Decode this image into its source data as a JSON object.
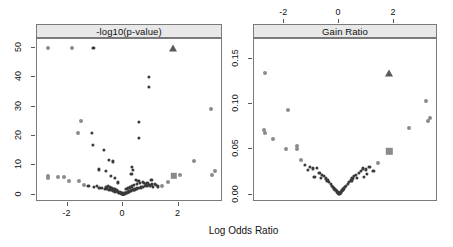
{
  "figure": {
    "xlabel": "Log Odds Ratio",
    "panels": [
      {
        "key": "pval",
        "strip_label": "-log10(p-value)"
      },
      {
        "key": "gain",
        "strip_label": "Gain Ratio"
      }
    ]
  },
  "colors": {
    "strip_fill": "#e8e8e8",
    "frame": "#7a7a7a",
    "point_dense": "#3a3a3a",
    "point_light": "#8b8b8b",
    "highlight_triangle": "#5a5a5a",
    "highlight_square": "#8a8a8a",
    "text": "#111111"
  },
  "chart_data": [
    {
      "type": "scatter",
      "panel": "-log10(p-value)",
      "title": "-log10(p-value)",
      "xlabel": "Log Odds Ratio",
      "ylabel": "-log10(p-value)",
      "xlim": [
        -3.1,
        3.6
      ],
      "ylim": [
        -2.5,
        53
      ],
      "xticks": [
        -2,
        0,
        2
      ],
      "xticklabels": [
        "-2",
        "0",
        "2"
      ],
      "xaxis_side": "bottom",
      "yticks": [
        0,
        10,
        20,
        30,
        40,
        50
      ],
      "yticklabels": [
        "0",
        "10",
        "20",
        "30",
        "40",
        "50"
      ],
      "grid": false,
      "legend": false,
      "points": [
        [
          -2.7,
          50.0
        ],
        [
          -1.85,
          50.0
        ],
        [
          -1.07,
          50.0
        ],
        [
          0.92,
          40.2
        ],
        [
          0.92,
          36.8
        ],
        [
          3.18,
          29.2
        ],
        [
          -1.53,
          25.2
        ],
        [
          0.58,
          24.9
        ],
        [
          -1.62,
          20.9
        ],
        [
          -1.12,
          21.1
        ],
        [
          0.57,
          19.2
        ],
        [
          -1.1,
          17.0
        ],
        [
          -0.7,
          15.3
        ],
        [
          -0.52,
          11.8
        ],
        [
          -0.38,
          11.3
        ],
        [
          2.55,
          11.4
        ],
        [
          -0.88,
          8.6
        ],
        [
          -0.62,
          8.1
        ],
        [
          0.33,
          9.5
        ],
        [
          0.35,
          8.3
        ],
        [
          3.3,
          7.9
        ],
        [
          3.22,
          6.8
        ],
        [
          2.05,
          6.6
        ],
        [
          -2.72,
          6.3
        ],
        [
          -2.7,
          5.7
        ],
        [
          -2.35,
          6.1
        ],
        [
          -2.12,
          5.9
        ],
        [
          -1.95,
          4.7
        ],
        [
          -1.58,
          4.6
        ],
        [
          -0.45,
          6.4
        ],
        [
          -0.3,
          5.6
        ],
        [
          -0.18,
          4.2
        ],
        [
          0.3,
          7.2
        ],
        [
          0.45,
          5.0
        ],
        [
          0.55,
          4.6
        ],
        [
          0.72,
          4.4
        ],
        [
          0.88,
          4.1
        ],
        [
          1.02,
          5.1
        ],
        [
          1.18,
          3.2
        ],
        [
          1.42,
          3.1
        ],
        [
          1.62,
          4.3
        ],
        [
          -1.4,
          3.4
        ],
        [
          -1.25,
          3.0
        ],
        [
          -1.05,
          2.6
        ],
        [
          -0.95,
          2.9
        ],
        [
          -0.85,
          2.2
        ],
        [
          -0.75,
          2.4
        ],
        [
          -0.66,
          1.9
        ],
        [
          -0.58,
          2.1
        ],
        [
          -0.5,
          1.6
        ],
        [
          -0.44,
          1.8
        ],
        [
          -0.38,
          1.3
        ],
        [
          -0.33,
          1.5
        ],
        [
          -0.28,
          1.1
        ],
        [
          -0.24,
          1.2
        ],
        [
          -0.2,
          0.85
        ],
        [
          -0.17,
          0.95
        ],
        [
          -0.14,
          0.7
        ],
        [
          -0.11,
          0.75
        ],
        [
          -0.09,
          0.55
        ],
        [
          -0.07,
          0.6
        ],
        [
          -0.05,
          0.4
        ],
        [
          -0.04,
          0.45
        ],
        [
          -0.02,
          0.3
        ],
        [
          -0.01,
          0.25
        ],
        [
          0.01,
          0.22
        ],
        [
          0.02,
          0.3
        ],
        [
          0.04,
          0.38
        ],
        [
          0.05,
          0.45
        ],
        [
          0.07,
          0.5
        ],
        [
          0.09,
          0.58
        ],
        [
          0.11,
          0.66
        ],
        [
          0.13,
          0.72
        ],
        [
          0.16,
          0.85
        ],
        [
          0.19,
          0.95
        ],
        [
          0.22,
          1.1
        ],
        [
          0.25,
          1.2
        ],
        [
          0.29,
          1.35
        ],
        [
          0.33,
          1.5
        ],
        [
          0.37,
          1.65
        ],
        [
          0.41,
          1.8
        ],
        [
          0.46,
          1.95
        ],
        [
          0.51,
          2.15
        ],
        [
          0.57,
          2.3
        ],
        [
          0.63,
          2.5
        ],
        [
          0.7,
          2.7
        ],
        [
          0.78,
          2.9
        ],
        [
          0.86,
          3.1
        ],
        [
          0.95,
          3.3
        ],
        [
          1.05,
          3.5
        ],
        [
          1.15,
          3.7
        ],
        [
          -0.62,
          2.6
        ],
        [
          -0.55,
          2.9
        ],
        [
          -0.48,
          2.5
        ],
        [
          -0.42,
          2.2
        ],
        [
          -0.36,
          2.0
        ],
        [
          -0.31,
          1.85
        ],
        [
          -0.26,
          1.7
        ],
        [
          -0.22,
          1.55
        ],
        [
          0.12,
          1.9
        ],
        [
          0.18,
          2.2
        ],
        [
          0.24,
          2.5
        ],
        [
          0.31,
          2.8
        ],
        [
          0.4,
          3.2
        ],
        [
          0.5,
          3.6
        ],
        [
          0.6,
          3.9
        ],
        [
          0.74,
          4.0
        ],
        [
          0.84,
          3.5
        ],
        [
          0.96,
          2.9
        ],
        [
          1.08,
          2.6
        ],
        [
          1.25,
          2.8
        ]
      ],
      "highlight_triangle": [
        1.8,
        50.0
      ],
      "highlight_square": [
        1.82,
        6.5
      ]
    },
    {
      "type": "scatter",
      "panel": "Gain Ratio",
      "title": "Gain Ratio",
      "xlabel": "Log Odds Ratio",
      "ylabel": "Gain Ratio",
      "xlim": [
        -3.1,
        3.6
      ],
      "ylim": [
        -0.008,
        0.172
      ],
      "xticks": [
        -2,
        0,
        2
      ],
      "xticklabels": [
        "-2",
        "0",
        "2"
      ],
      "xaxis_side": "top",
      "yticks": [
        0.0,
        0.05,
        0.1,
        0.15
      ],
      "yticklabels": [
        "0.00",
        "0.05",
        "0.10",
        "0.15"
      ],
      "grid": false,
      "legend": false,
      "points": [
        [
          -2.7,
          0.135
        ],
        [
          -1.85,
          0.094
        ],
        [
          -2.72,
          0.071
        ],
        [
          -2.7,
          0.068
        ],
        [
          -2.4,
          0.062
        ],
        [
          -1.95,
          0.051
        ],
        [
          -1.55,
          0.054
        ],
        [
          -1.52,
          0.05
        ],
        [
          -1.4,
          0.038
        ],
        [
          -1.25,
          0.033
        ],
        [
          -1.07,
          0.031
        ],
        [
          -0.95,
          0.029
        ],
        [
          -0.8,
          0.03
        ],
        [
          -0.72,
          0.024
        ],
        [
          -0.62,
          0.022
        ],
        [
          -0.55,
          0.021
        ],
        [
          -0.48,
          0.018
        ],
        [
          -0.42,
          0.016
        ],
        [
          -0.36,
          0.014
        ],
        [
          -0.31,
          0.012
        ],
        [
          -0.26,
          0.01
        ],
        [
          -0.22,
          0.009
        ],
        [
          -0.18,
          0.007
        ],
        [
          -0.15,
          0.006
        ],
        [
          -0.12,
          0.005
        ],
        [
          -0.09,
          0.004
        ],
        [
          -0.07,
          0.003
        ],
        [
          -0.05,
          0.0025
        ],
        [
          -0.03,
          0.002
        ],
        [
          -0.01,
          0.0015
        ],
        [
          0.01,
          0.0015
        ],
        [
          0.03,
          0.002
        ],
        [
          0.05,
          0.0025
        ],
        [
          0.07,
          0.003
        ],
        [
          0.09,
          0.004
        ],
        [
          0.12,
          0.005
        ],
        [
          0.15,
          0.006
        ],
        [
          0.18,
          0.007
        ],
        [
          0.22,
          0.009
        ],
        [
          0.26,
          0.01
        ],
        [
          0.31,
          0.012
        ],
        [
          0.36,
          0.014
        ],
        [
          0.42,
          0.016
        ],
        [
          0.48,
          0.018
        ],
        [
          0.55,
          0.021
        ],
        [
          0.62,
          0.022
        ],
        [
          0.72,
          0.024
        ],
        [
          0.8,
          0.026
        ],
        [
          0.88,
          0.029
        ],
        [
          0.98,
          0.028
        ],
        [
          1.1,
          0.031
        ],
        [
          1.25,
          0.026
        ],
        [
          1.42,
          0.035
        ],
        [
          -0.9,
          0.02
        ],
        [
          -0.66,
          0.019
        ],
        [
          -0.45,
          0.015
        ],
        [
          0.45,
          0.015
        ],
        [
          0.66,
          0.019
        ],
        [
          0.9,
          0.02
        ],
        [
          2.55,
          0.074
        ],
        [
          3.18,
          0.104
        ],
        [
          3.22,
          0.081
        ],
        [
          3.3,
          0.085
        ],
        [
          -1.15,
          0.027
        ],
        [
          1.02,
          0.023
        ]
      ],
      "highlight_triangle": [
        1.8,
        0.135
      ],
      "highlight_square": [
        1.82,
        0.048
      ]
    }
  ]
}
